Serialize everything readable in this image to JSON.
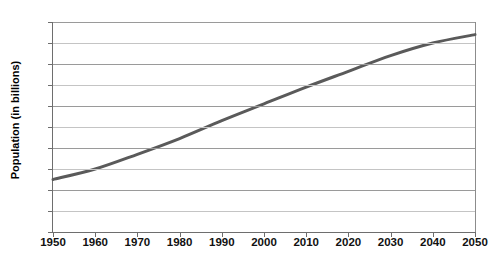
{
  "chart_data": {
    "type": "line",
    "title": "",
    "xlabel": "",
    "ylabel": "Population (in billions)",
    "xlim": [
      1950,
      2050
    ],
    "ylim": [
      0,
      10
    ],
    "grid": true,
    "legend": "none",
    "x": [
      1950,
      1960,
      1970,
      1980,
      1990,
      2000,
      2010,
      2020,
      2030,
      2040,
      2050
    ],
    "xticklabels": [
      "1950",
      "1960",
      "1970",
      "1980",
      "1990",
      "2000",
      "2010",
      "2020",
      "2030",
      "2040",
      "2050"
    ],
    "yticks": [
      0,
      1,
      2,
      3,
      4,
      5,
      6,
      7,
      8,
      9,
      10
    ],
    "yticklabels": [
      "0",
      "1",
      "2",
      "3",
      "4",
      "5",
      "6",
      "7",
      "8",
      "9",
      "10"
    ],
    "series": [
      {
        "name": "World population",
        "color": "#5a5a5a",
        "line_width": 3,
        "values": [
          2.5,
          3.0,
          3.7,
          4.45,
          5.3,
          6.1,
          6.9,
          7.65,
          8.4,
          9.0,
          9.4
        ]
      }
    ]
  },
  "axes": {
    "y_title": "Population (in billions)"
  },
  "footer": {
    "artifact_text": ""
  }
}
